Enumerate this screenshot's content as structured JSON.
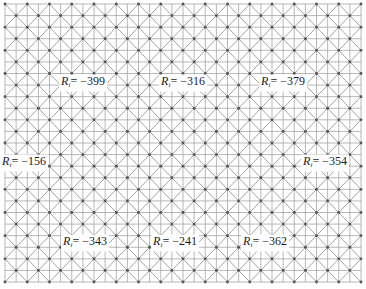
{
  "diagram": {
    "type": "square lattice with face-centered points, diagonal connections and bisecting grid lines",
    "grid": {
      "left": 5,
      "top": 4,
      "right": 361,
      "bottom": 282,
      "columns": 16,
      "rows": 12,
      "line_color": "#9a9a9a",
      "diagonal_color": "#8a8a8a",
      "dot_color": "#555555"
    },
    "label_symbol": "R",
    "label_subscript": "i",
    "labels": [
      {
        "id": "r-top-left",
        "value": "= −399",
        "x": 83,
        "y": 83
      },
      {
        "id": "r-top-center",
        "value": "= −316",
        "x": 183,
        "y": 83
      },
      {
        "id": "r-top-right",
        "value": "= −379",
        "x": 283,
        "y": 83
      },
      {
        "id": "r-mid-left",
        "value": "= −156",
        "x": 24,
        "y": 163
      },
      {
        "id": "r-mid-right",
        "value": "= −354",
        "x": 325,
        "y": 163
      },
      {
        "id": "r-bottom-left",
        "value": "= −343",
        "x": 85,
        "y": 243
      },
      {
        "id": "r-bottom-center",
        "value": "= −241",
        "x": 175,
        "y": 243
      },
      {
        "id": "r-bottom-right",
        "value": "= −362",
        "x": 265,
        "y": 243
      }
    ]
  }
}
